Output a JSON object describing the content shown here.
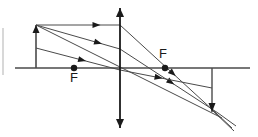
{
  "figure": {
    "kind": "optics-ray-diagram",
    "title": "",
    "background_color": "#ffffff",
    "line_color": "#4a4a4a",
    "dark_color": "#1a1a1a",
    "width": 258,
    "height": 137
  },
  "labels": {
    "focal_left": "F",
    "focal_right": "F"
  },
  "chart_data": {
    "type": "diagram",
    "axis": {
      "name": "principal-axis",
      "y": 68,
      "x_start": 15,
      "x_end": 250
    },
    "lens": {
      "name": "converging-lens",
      "x": 120,
      "y_top": 8,
      "y_bottom": 128,
      "arrowheads": [
        "top",
        "bottom"
      ]
    },
    "object": {
      "name": "object-arrow",
      "x": 36,
      "base_y": 68,
      "tip_y": 25,
      "direction": "up",
      "height": 43
    },
    "image": {
      "name": "image-arrow",
      "x": 212,
      "base_y": 68,
      "tip_y": 112,
      "direction": "down",
      "height": 44
    },
    "focal_points": [
      {
        "label": "F",
        "x": 74,
        "y": 68,
        "side": "left",
        "label_x": 74,
        "label_y": 82
      },
      {
        "label": "F",
        "x": 165,
        "y": 68,
        "side": "right",
        "label_x": 163,
        "label_y": 58
      }
    ],
    "rays": [
      {
        "name": "parallel-ray-incident",
        "x1": 36,
        "y1": 25,
        "x2": 120,
        "y2": 25,
        "marker_t": 0.72
      },
      {
        "name": "parallel-ray-refracted",
        "x1": 120,
        "y1": 25,
        "x2": 216,
        "y2": 113,
        "marker_t": 0.55
      },
      {
        "name": "focal-ray-incident",
        "x1": 36,
        "y1": 25,
        "x2": 120,
        "y2": 49,
        "marker_t": 0.74
      },
      {
        "name": "focal-ray-refracted",
        "x1": 120,
        "y1": 49,
        "x2": 218,
        "y2": 113,
        "marker_t": 0.52
      },
      {
        "name": "center-ray",
        "x1": 36,
        "y1": 25,
        "x2": 222,
        "y2": 118,
        "marker_t": 0.0
      },
      {
        "name": "lower-ray-incident",
        "x1": 36,
        "y1": 48,
        "x2": 120,
        "y2": 70,
        "marker_t": 0.55
      },
      {
        "name": "lower-ray-refracted",
        "x1": 120,
        "y1": 70,
        "x2": 212,
        "y2": 88,
        "marker_t": 0.42
      },
      {
        "name": "convergence-overshoot-a",
        "x1": 216,
        "y1": 113,
        "x2": 232,
        "y2": 128
      },
      {
        "name": "convergence-overshoot-b",
        "x1": 218,
        "y1": 113,
        "x2": 236,
        "y2": 126
      },
      {
        "name": "convergence-overshoot-c",
        "x1": 212,
        "y1": 110,
        "x2": 234,
        "y2": 131
      }
    ],
    "edge_mark": {
      "name": "left-edge-tick",
      "x": 3,
      "y_top": 28,
      "y_bottom": 75
    }
  }
}
